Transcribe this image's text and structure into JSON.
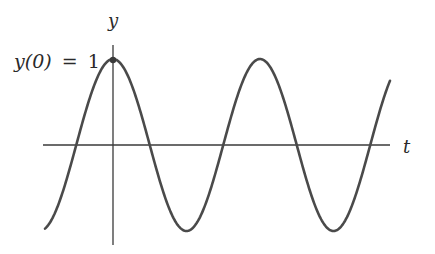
{
  "chart_data": {
    "type": "line",
    "title": "",
    "xlabel": "t",
    "ylabel": "y",
    "annotation": "y(0) = 1",
    "function": "y = cos(t)",
    "grid": false,
    "legend": null,
    "x": [
      -1.5708,
      0,
      1.5708,
      3.1416,
      4.7124,
      6.2832,
      7.854,
      9.4248,
      10.9956,
      12.2
    ],
    "values": [
      0,
      1,
      0,
      -1,
      0,
      1,
      0,
      -1,
      0,
      0.8
    ],
    "ylim": [
      -1,
      1
    ],
    "colors": {
      "curve": "#4a4a4a",
      "axes": "#3a3a3a",
      "text": "#2a2a2a"
    }
  },
  "labels": {
    "y_axis": "y",
    "t_axis": "t",
    "initial_value_lhs": "y(0)",
    "initial_value_eq": "=",
    "initial_value_rhs": "1"
  }
}
